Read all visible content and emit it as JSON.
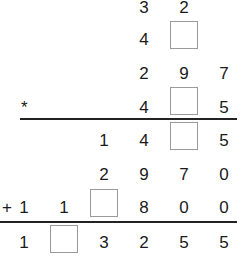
{
  "puzzle": {
    "rows": [
      {
        "cells": [
          "",
          "",
          "",
          "3",
          "2",
          ""
        ]
      },
      {
        "cells": [
          "",
          "",
          "",
          "4",
          "[]",
          ""
        ]
      },
      {
        "cells": [
          "",
          "",
          "",
          "2",
          "9",
          "7"
        ]
      },
      {
        "operator": "*",
        "cells": [
          "",
          "",
          "",
          "4",
          "[]",
          "5"
        ]
      },
      {
        "cells": [
          "",
          "",
          "1",
          "4",
          "[]",
          "5"
        ]
      },
      {
        "cells": [
          "",
          "",
          "2",
          "9",
          "7",
          "0"
        ]
      },
      {
        "operator": "+",
        "cells": [
          "1",
          "1",
          "[]",
          "8",
          "0",
          "0"
        ]
      },
      {
        "cells": [
          "1",
          "[]",
          "3",
          "2",
          "5",
          "5"
        ]
      }
    ],
    "r0": {
      "c3": "3",
      "c4": "2"
    },
    "r1": {
      "c3": "4"
    },
    "r2": {
      "c3": "2",
      "c4": "9",
      "c5": "7"
    },
    "r3": {
      "op": "*",
      "c3": "4",
      "c5": "5"
    },
    "r4": {
      "c2": "1",
      "c3": "4",
      "c5": "5"
    },
    "r5": {
      "c2": "2",
      "c3": "9",
      "c4": "7",
      "c5": "0"
    },
    "r6": {
      "op": "+",
      "c0": "1",
      "c1": "1",
      "c3": "8",
      "c4": "0",
      "c5": "0"
    },
    "r7": {
      "c0": "1",
      "c2": "3",
      "c3": "2",
      "c4": "5",
      "c5": "5"
    }
  }
}
